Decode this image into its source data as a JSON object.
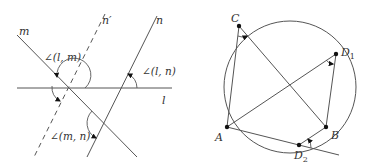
{
  "figure_left": {
    "lines": [
      {
        "id": "l",
        "label": "l",
        "style": "solid"
      },
      {
        "id": "m",
        "label": "m",
        "style": "solid"
      },
      {
        "id": "n",
        "label": "n",
        "style": "solid"
      },
      {
        "id": "n_prime",
        "label": "n′",
        "style": "dashed"
      }
    ],
    "angle_labels": {
      "lm": "∠(l, m)",
      "ln": "∠(l, n)",
      "mn": "∠(m, n)"
    }
  },
  "figure_right": {
    "points": [
      {
        "id": "A",
        "label": "A"
      },
      {
        "id": "B",
        "label": "B"
      },
      {
        "id": "C",
        "label": "C"
      },
      {
        "id": "D1",
        "label": "D",
        "subscript": "1"
      },
      {
        "id": "D2",
        "label": "D",
        "subscript": "2"
      }
    ],
    "shape": "circle"
  },
  "colors": {
    "stroke": "#555555",
    "text": "#333333",
    "point": "#111111",
    "background": "#ffffff"
  }
}
